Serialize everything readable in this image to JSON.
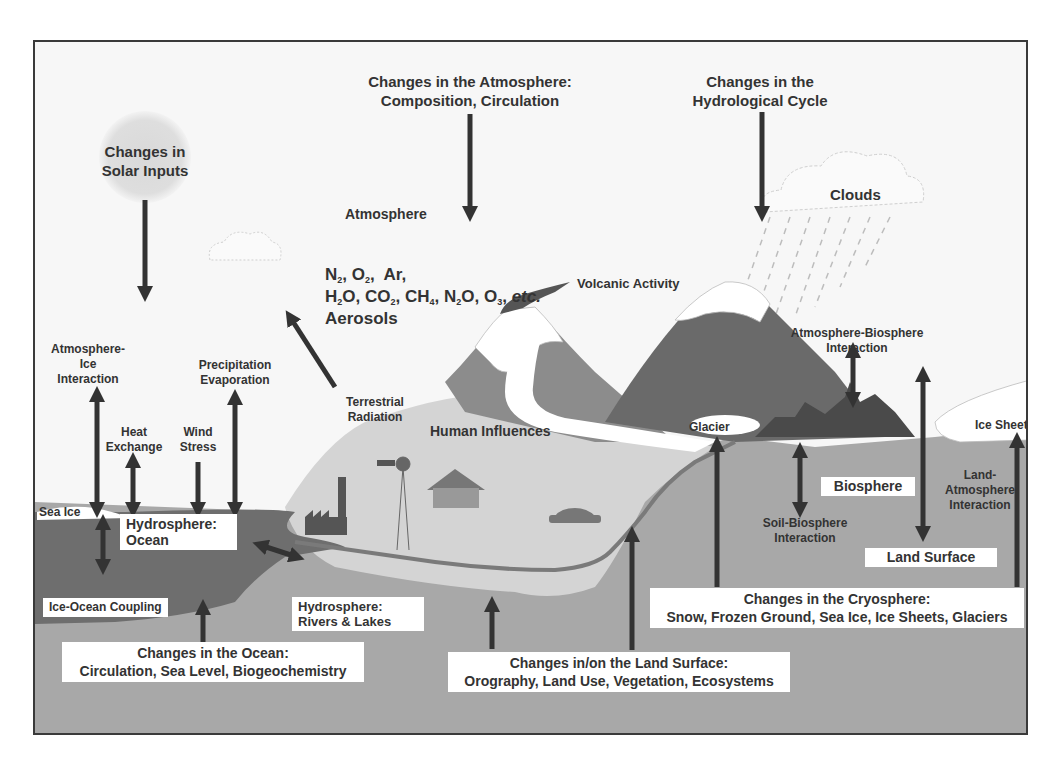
{
  "diagram": {
    "drivers": {
      "solar": {
        "line1": "Changes in",
        "line2": "Solar Inputs"
      },
      "atmosphere": {
        "line1": "Changes in the Atmosphere:",
        "line2": "Composition, Circulation"
      },
      "hydrological": {
        "line1": "Changes in the",
        "line2": "Hydrological Cycle"
      },
      "ocean": {
        "line1": "Changes in the Ocean:",
        "line2": "Circulation, Sea Level, Biogeochemistry"
      },
      "land": {
        "line1": "Changes in/on the Land Surface:",
        "line2": "Orography, Land Use, Vegetation, Ecosystems"
      },
      "cryosphere": {
        "line1": "Changes in the Cryosphere:",
        "line2": "Snow, Frozen Ground, Sea Ice, Ice Sheets, Glaciers"
      }
    },
    "atmosphere": {
      "label": "Atmosphere",
      "gases_line1": [
        "N2",
        "O2",
        "Ar"
      ],
      "gases_line2": [
        "H2O",
        "CO2",
        "CH4",
        "N2O",
        "O3",
        "etc."
      ],
      "aerosols": "Aerosols"
    },
    "components": {
      "clouds": "Clouds",
      "volcanic": "Volcanic Activity",
      "human": "Human Influences",
      "glacier": "Glacier",
      "ice_sheet": "Ice Sheet",
      "sea_ice": "Sea Ice",
      "biosphere": "Biosphere",
      "land_surface": "Land Surface",
      "ocean": {
        "line1": "Hydrosphere:",
        "line2": "Ocean"
      },
      "rivers": {
        "line1": "Hydrosphere:",
        "line2": "Rivers & Lakes"
      }
    },
    "interactions": {
      "atm_ice": {
        "line1": "Atmosphere-",
        "line2": "Ice",
        "line3": "Interaction"
      },
      "heat": {
        "line1": "Heat",
        "line2": "Exchange"
      },
      "wind": {
        "line1": "Wind",
        "line2": "Stress"
      },
      "precip": {
        "line1": "Precipitation",
        "line2": "Evaporation"
      },
      "terrestrial": {
        "line1": "Terrestrial",
        "line2": "Radiation"
      },
      "ice_ocean": "Ice-Ocean Coupling",
      "atm_bio": {
        "line1": "Atmosphere-Biosphere",
        "line2": "Interaction"
      },
      "soil_bio": {
        "line1": "Soil-Biosphere",
        "line2": "Interaction"
      },
      "land_atm": {
        "line1": "Land-",
        "line2": "Atmosphere",
        "line3": "Interaction"
      }
    },
    "colors": {
      "frame": "#3a3a3a",
      "sky": "#f7f7f7",
      "ground": "#a8a8a8",
      "ocean": "#6e6e6e",
      "plain": "#d4d4d4",
      "mountain_dark": "#6a6a6a",
      "mountain_mid": "#8c8c8c",
      "arrow": "#333333",
      "text": "#333333"
    }
  }
}
